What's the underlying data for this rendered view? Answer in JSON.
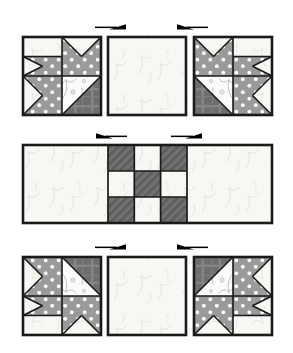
{
  "diagram": {
    "title": "Quilt Block Assembly Diagram",
    "background": "#ffffff"
  },
  "palette": {
    "outline": "#1a1a1a",
    "light_print": "#f7f7f4",
    "light_print_edge": "#e8e8e2",
    "polka_dot": "#9a9a9a",
    "polka_dot_spot": "#ffffff",
    "dark_plaid": "#6e6e6e",
    "dark_plaid_line": "#8d8d8d",
    "hatch_dark": "#6b6b6b",
    "hatch_line": "#4a4a4a",
    "arrow": "#000000",
    "floral_line": "#b9b9b9"
  },
  "layout": {
    "canvas_width": 293,
    "canvas_height": 353,
    "rows": [
      {
        "name": "top-row",
        "y": 37,
        "height": 78
      },
      {
        "name": "middle-row",
        "y": 145,
        "height": 78
      },
      {
        "name": "bottom-row",
        "y": 257,
        "height": 78
      }
    ],
    "columns": [
      {
        "name": "left-column",
        "x": 23,
        "width": 78
      },
      {
        "name": "center-column",
        "x": 108,
        "width": 78
      },
      {
        "name": "right-column",
        "x": 194,
        "width": 78
      }
    ]
  },
  "units": {
    "top_left": {
      "name": "star-unit-top-left",
      "label": "Star corner unit, top left",
      "orientation": "point-down-right"
    },
    "top_center": {
      "name": "plain-square-top-center",
      "label": "Plain light print square",
      "fabric": "light-print"
    },
    "top_right": {
      "name": "star-unit-top-right",
      "label": "Star corner unit, top right",
      "orientation": "point-down-left"
    },
    "middle_strip": {
      "name": "center-rectangle-strip",
      "label": "Center rectangle with nine-patch",
      "left_patch": "light-print",
      "right_patch": "light-print",
      "ninepatch": {
        "name": "nine-patch",
        "cells": [
          [
            "dark",
            "light",
            "dark"
          ],
          [
            "light",
            "dark",
            "light"
          ],
          [
            "dark",
            "light",
            "dark"
          ]
        ]
      }
    },
    "bottom_left": {
      "name": "star-unit-bottom-left",
      "label": "Star corner unit, bottom left",
      "orientation": "point-up-right"
    },
    "bottom_center": {
      "name": "plain-square-bottom-center",
      "label": "Plain light print square",
      "fabric": "light-print"
    },
    "bottom_right": {
      "name": "star-unit-bottom-right",
      "label": "Star corner unit, bottom right",
      "orientation": "point-up-left"
    }
  },
  "arrows": [
    {
      "name": "arrow-top-left",
      "row": "top",
      "side": "left",
      "direction": "right",
      "x": 95,
      "y": 26
    },
    {
      "name": "arrow-top-right",
      "row": "top",
      "side": "right",
      "direction": "left",
      "x": 177,
      "y": 26
    },
    {
      "name": "arrow-middle-left",
      "row": "middle",
      "side": "left",
      "direction": "left",
      "x": 98,
      "y": 135
    },
    {
      "name": "arrow-middle-right",
      "row": "middle",
      "side": "right",
      "direction": "right",
      "x": 173,
      "y": 135
    },
    {
      "name": "arrow-bottom-left",
      "row": "bottom",
      "side": "left",
      "direction": "right",
      "x": 97,
      "y": 246
    },
    {
      "name": "arrow-bottom-right",
      "row": "bottom",
      "side": "right",
      "direction": "left",
      "x": 175,
      "y": 246
    }
  ]
}
